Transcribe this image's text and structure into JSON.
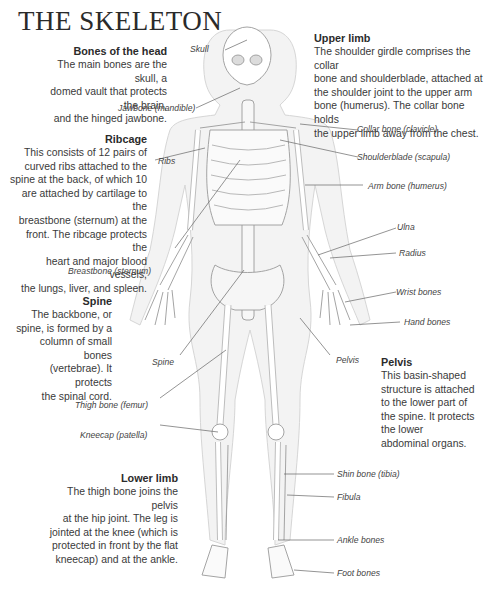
{
  "title": "THE SKELETON",
  "sections": {
    "head": {
      "heading": "Bones of the head",
      "text_lines": [
        "The main bones are the skull, a",
        "domed vault that protects the brain,",
        "and the hinged jawbone."
      ]
    },
    "upper_limb": {
      "heading": "Upper limb",
      "text_lines": [
        "The shoulder girdle comprises the collar",
        "bone and shoulderblade, attached at",
        "the shoulder joint to the upper arm",
        "bone (humerus). The collar bone holds",
        "the upper limb away from the chest."
      ]
    },
    "ribcage": {
      "heading": "Ribcage",
      "text_lines": [
        "This consists of 12 pairs of",
        "curved ribs attached to the",
        "spine at the back, of which 10",
        "are attached by cartilage to the",
        "breastbone (sternum) at the",
        "front. The ribcage protects the",
        "heart and major blood vessels,",
        "the lungs, liver, and spleen."
      ]
    },
    "spine": {
      "heading": "Spine",
      "text_lines": [
        "The backbone, or",
        "spine, is formed by a",
        "column of small bones",
        "(vertebrae). It protects",
        "the spinal cord."
      ]
    },
    "pelvis": {
      "heading": "Pelvis",
      "text_lines": [
        "This basin-shaped",
        "structure is attached",
        "to the lower part of",
        "the spine. It protects",
        "the lower",
        "abdominal organs."
      ]
    },
    "lower_limb": {
      "heading": "Lower limb",
      "text_lines": [
        "The thigh bone joins the pelvis",
        "at the hip joint. The leg is",
        "jointed at the knee (which is",
        "protected in front by the flat",
        "kneecap) and at the ankle."
      ]
    }
  },
  "labels": {
    "skull": "Skull",
    "jawbone": "Jawbone (mandible)",
    "ribs": "Ribs",
    "breastbone": "Breastbone (sternum)",
    "spine": "Spine",
    "thigh_bone": "Thigh bone (femur)",
    "kneecap": "Kneecap (patella)",
    "collar_bone": "Collar bone (clavicle)",
    "shoulderblade": "Shoulderblade (scapula)",
    "arm_bone": "Arm bone (humerus)",
    "ulna": "Ulna",
    "radius": "Radius",
    "wrist_bones": "Wrist bones",
    "hand_bones": "Hand bones",
    "pelvis": "Pelvis",
    "shin_bone": "Shin bone (tibia)",
    "fibula": "Fibula",
    "ankle_bones": "Ankle bones",
    "foot_bones": "Foot bones"
  }
}
